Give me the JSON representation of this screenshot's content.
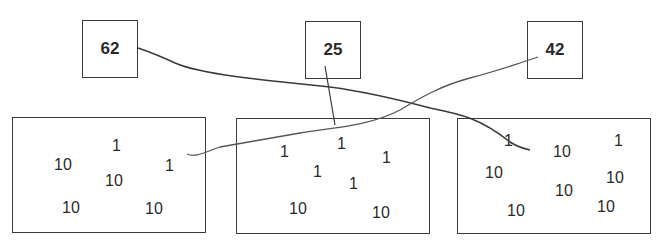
{
  "labels": [
    {
      "id": "label-62",
      "value": "62"
    },
    {
      "id": "label-25",
      "value": "25"
    },
    {
      "id": "label-42",
      "value": "42"
    }
  ],
  "groups": [
    {
      "id": "group-left",
      "sum": 42,
      "numbers": [
        "1",
        "10",
        "1",
        "10",
        "10",
        "10"
      ]
    },
    {
      "id": "group-middle",
      "sum": 25,
      "numbers": [
        "1",
        "1",
        "1",
        "1",
        "1",
        "10",
        "10"
      ]
    },
    {
      "id": "group-right",
      "sum": 62,
      "numbers": [
        "1",
        "10",
        "1",
        "10",
        "10",
        "10",
        "10",
        "10"
      ]
    }
  ],
  "connections": [
    {
      "from": "62",
      "to": "group-right"
    },
    {
      "from": "25",
      "to": "group-middle"
    },
    {
      "from": "42",
      "to": "group-left"
    }
  ],
  "colors": {
    "line": "#3a3a3a",
    "text": "#2a2a2a",
    "background": "#ffffff"
  }
}
